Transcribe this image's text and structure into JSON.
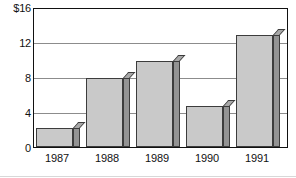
{
  "chart_data": {
    "type": "bar",
    "title": "",
    "xlabel": "",
    "ylabel": "",
    "categories": [
      "1987",
      "1988",
      "1989",
      "1990",
      "1991"
    ],
    "values": [
      2.9,
      8.7,
      10.7,
      5.5,
      13.7
    ],
    "ylim": [
      0,
      16
    ],
    "yticks": [
      0,
      4,
      8,
      12,
      16
    ],
    "ytick_labels": [
      "0",
      "4",
      "8",
      "12",
      "$16"
    ],
    "grid": true,
    "legend": "none",
    "style": "3d-shaded-bars",
    "units": "dollars",
    "colors": {
      "bar_face": "#c9c9c9",
      "bar_side": "#939393",
      "bar_top": "#a8a8a8",
      "bar_outline": "#3c3c3c",
      "gridline": "#8c8c8c",
      "frame": "#111111",
      "text": "#111111",
      "background": "#ffffff"
    }
  },
  "axes": {
    "y": {
      "ticks": [
        {
          "label": "$16",
          "value": 16
        },
        {
          "label": "12",
          "value": 12
        },
        {
          "label": "8",
          "value": 8
        },
        {
          "label": "4",
          "value": 4
        },
        {
          "label": "0",
          "value": 0
        }
      ]
    },
    "x": {
      "ticks": [
        {
          "label": "1987"
        },
        {
          "label": "1988"
        },
        {
          "label": "1989"
        },
        {
          "label": "1990"
        },
        {
          "label": "1991"
        }
      ]
    }
  }
}
